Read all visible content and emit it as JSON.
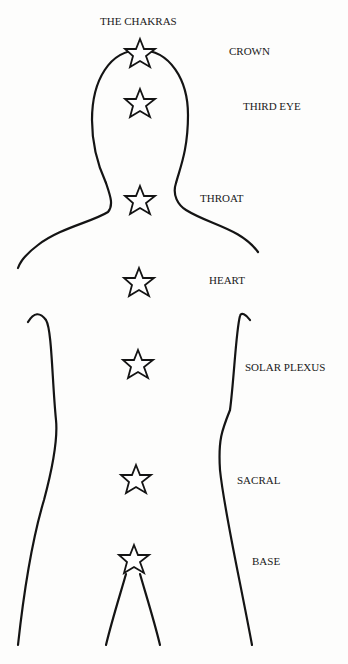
{
  "title": "THE CHAKRAS",
  "chakras": [
    {
      "name": "CROWN",
      "label_x": 229,
      "label_y": 46,
      "star_x": 140,
      "star_y": 55
    },
    {
      "name": "THIRD EYE",
      "label_x": 243,
      "label_y": 101,
      "star_x": 140,
      "star_y": 103
    },
    {
      "name": "THROAT",
      "label_x": 200,
      "label_y": 193,
      "star_x": 140,
      "star_y": 202
    },
    {
      "name": "HEART",
      "label_x": 209,
      "label_y": 275,
      "star_x": 139,
      "star_y": 283
    },
    {
      "name": "SOLAR PLEXUS",
      "label_x": 245,
      "label_y": 362,
      "star_x": 138,
      "star_y": 366
    },
    {
      "name": "SACRAL",
      "label_x": 237,
      "label_y": 474,
      "star_x": 136,
      "star_y": 481
    },
    {
      "name": "BASE",
      "label_x": 252,
      "label_y": 555,
      "star_x": 134,
      "star_y": 560
    }
  ],
  "colors": {
    "line": "#141414",
    "text": "#1a1a1a",
    "background": "#fdfdfc"
  }
}
